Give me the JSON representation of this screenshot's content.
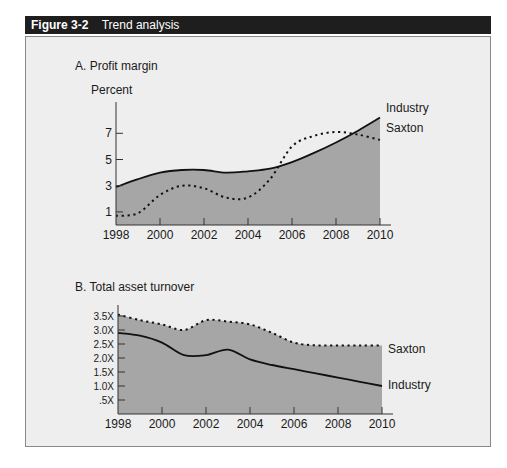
{
  "figure": {
    "number": "Figure 3-2",
    "title": "Trend analysis"
  },
  "colors": {
    "header_bg": "#1e1e1e",
    "panel_bg": "#eeeeee",
    "area_fill": "#a6a6a6",
    "line": "#111111"
  },
  "chart_data": [
    {
      "type": "area",
      "title": "A. Profit margin",
      "ylabel": "Percent",
      "xlabel": "",
      "x": [
        1998,
        1999,
        2000,
        2001,
        2002,
        2003,
        2004,
        2005,
        2006,
        2007,
        2008,
        2009,
        2010
      ],
      "x_ticks": [
        "1998",
        "2000",
        "2002",
        "2004",
        "2006",
        "2008",
        "2010"
      ],
      "y_ticks": [
        "1",
        "3",
        "5",
        "7"
      ],
      "ylim": [
        0,
        9
      ],
      "grid": false,
      "legend_position": "inline-right",
      "series": [
        {
          "name": "Industry",
          "style": "solid",
          "values": [
            2.9,
            3.5,
            4.0,
            4.2,
            4.2,
            4.0,
            4.1,
            4.3,
            4.8,
            5.5,
            6.3,
            7.2,
            8.2
          ]
        },
        {
          "name": "Saxton",
          "style": "dotted",
          "values": [
            0.7,
            0.9,
            2.3,
            3.0,
            2.8,
            2.1,
            2.1,
            3.5,
            6.0,
            6.8,
            7.1,
            6.9,
            6.5
          ]
        }
      ]
    },
    {
      "type": "area",
      "title": "B. Total asset turnover",
      "ylabel": "",
      "xlabel": "",
      "x": [
        1998,
        1999,
        2000,
        2001,
        2002,
        2003,
        2004,
        2005,
        2006,
        2007,
        2008,
        2009,
        2010
      ],
      "x_ticks": [
        "1998",
        "2000",
        "2002",
        "2004",
        "2006",
        "2008",
        "2010"
      ],
      "y_ticks": [
        ".5X",
        "1.0X",
        "1.5X",
        "2.0X",
        "2.5X",
        "3.0X",
        "3.5X"
      ],
      "ylim": [
        0,
        3.9
      ],
      "grid": false,
      "legend_position": "inline-right",
      "series": [
        {
          "name": "Saxton",
          "style": "dotted",
          "values": [
            3.55,
            3.35,
            3.2,
            3.0,
            3.35,
            3.3,
            3.2,
            2.9,
            2.55,
            2.45,
            2.45,
            2.45,
            2.45
          ]
        },
        {
          "name": "Industry",
          "style": "solid",
          "values": [
            2.9,
            2.8,
            2.55,
            2.1,
            2.1,
            2.3,
            1.95,
            1.75,
            1.6,
            1.45,
            1.3,
            1.15,
            1.0
          ]
        }
      ]
    }
  ]
}
